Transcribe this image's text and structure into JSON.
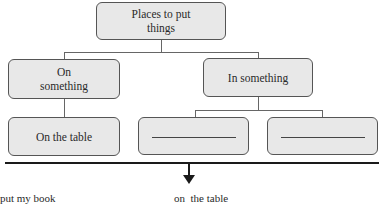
{
  "diagram": {
    "root": {
      "label": "Places to put things",
      "line1": "Places to put",
      "line2": "things"
    },
    "categories": [
      {
        "label": "On something",
        "line1": "On",
        "line2": "something",
        "children": [
          {
            "label": "On the table"
          }
        ]
      },
      {
        "label": "In something",
        "children": [
          {
            "label": "",
            "blank": true
          },
          {
            "label": "",
            "blank": true
          }
        ]
      }
    ]
  },
  "sentence": {
    "left": "put my book",
    "right": "on  the table"
  },
  "colors": {
    "box_fill": "#e8e8e8",
    "box_border": "#555555",
    "rule": "#1a1a1a"
  }
}
